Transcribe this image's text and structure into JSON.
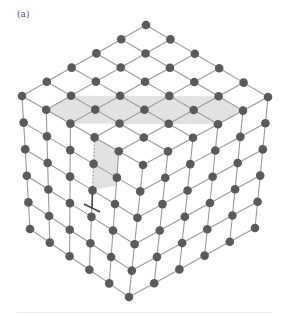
{
  "figure": {
    "label": "(a)",
    "n": 5,
    "geometry": {
      "back_top": [
        146,
        25
      ],
      "left_top": [
        22,
        96
      ],
      "right_top": [
        268,
        97
      ],
      "front_top": [
        143,
        165
      ],
      "front_bottom": [
        129,
        297
      ],
      "left_bottom": [
        30,
        229
      ],
      "right_bottom": [
        255,
        228
      ]
    },
    "colors": {
      "node": "#5a5a5a",
      "edge": "#9a9a9a",
      "shade": "#e2e2e2"
    },
    "node_radius": 4.3,
    "shaded_region": {
      "top_row_index": 2,
      "description": "strip on top face from right edge to front-left edge, continuing down the left face one cell"
    },
    "dislocation_symbol": {
      "glyph": "⊥",
      "position": [
        92,
        208
      ]
    }
  }
}
